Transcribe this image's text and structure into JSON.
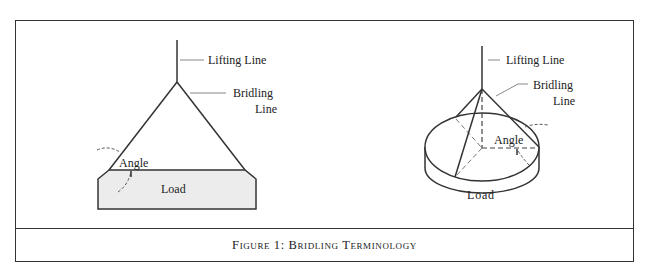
{
  "figure": {
    "caption": "Figure 1:  Bridling Terminology"
  },
  "left_diagram": {
    "labels": {
      "lifting_line": "Lifting Line",
      "bridling_line_1": "Bridling",
      "bridling_line_2": "Line",
      "angle": "Angle",
      "load": "Load"
    }
  },
  "right_diagram": {
    "labels": {
      "lifting_line": "Lifting Line",
      "bridling_line_1": "Bridling",
      "bridling_line_2": "Line",
      "angle": "Angle",
      "load": "Load"
    }
  },
  "colors": {
    "line": "#333333",
    "load_fill": "#ececec",
    "leader": "#888888"
  }
}
